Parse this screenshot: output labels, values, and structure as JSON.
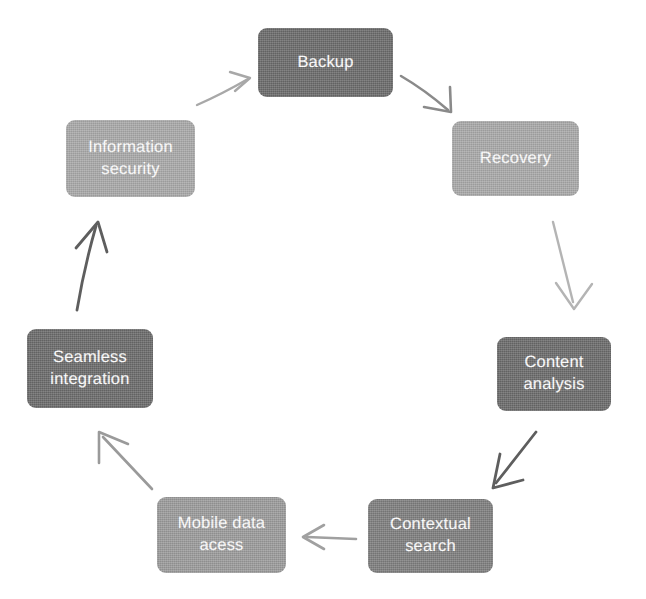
{
  "diagram": {
    "type": "cycle",
    "orientation": "clockwise",
    "background_color": "#ffffff",
    "node_count": 6,
    "arrow_count": 6,
    "nodes": [
      {
        "id": "backup",
        "label": "Backup",
        "lines": "Backup",
        "fill_color": "#6b6b6b",
        "text_color": "#ffffff",
        "position": "top"
      },
      {
        "id": "recovery",
        "label": "Recovery",
        "lines": "Recovery",
        "fill_color": "#a9a9a9",
        "text_color": "#ffffff",
        "position": "upper-right"
      },
      {
        "id": "content-analysis",
        "label": "Content analysis",
        "lines": "Content\nanalysis",
        "fill_color": "#6b6b6b",
        "text_color": "#ffffff",
        "position": "lower-right"
      },
      {
        "id": "contextual-search",
        "label": "Contextual search",
        "lines": "Contextual\nsearch",
        "fill_color": "#7e7e7e",
        "text_color": "#ffffff",
        "position": "bottom-right"
      },
      {
        "id": "mobile-data-acess",
        "label": "Mobile data acess",
        "lines": "Mobile data\nacess",
        "fill_color": "#9b9b9b",
        "text_color": "#ffffff",
        "position": "bottom-left"
      },
      {
        "id": "seamless-integration",
        "label": "Seamless integration",
        "lines": "Seamless\nintegration",
        "fill_color": "#6b6b6b",
        "text_color": "#ffffff",
        "position": "lower-left"
      },
      {
        "id": "information-security",
        "label": "Information security",
        "lines": "Information\nsecurity",
        "fill_color": "#a9a9a9",
        "text_color": "#ffffff",
        "position": "upper-left"
      }
    ],
    "arrows": [
      {
        "id": "arrow-backup-to-recovery",
        "from": "backup",
        "to": "recovery",
        "style": "curved",
        "color": "#8a8a8a"
      },
      {
        "id": "arrow-recovery-to-content",
        "from": "recovery",
        "to": "content-analysis",
        "style": "straight",
        "color": "#b4b4b4"
      },
      {
        "id": "arrow-content-to-contextual",
        "from": "content-analysis",
        "to": "contextual-search",
        "style": "straight",
        "color": "#5e5e5e"
      },
      {
        "id": "arrow-contextual-to-mobile",
        "from": "contextual-search",
        "to": "mobile-data-acess",
        "style": "straight",
        "color": "#a0a0a0"
      },
      {
        "id": "arrow-mobile-to-seamless",
        "from": "mobile-data-acess",
        "to": "seamless-integration",
        "style": "straight",
        "color": "#9a9a9a"
      },
      {
        "id": "arrow-seamless-to-security",
        "from": "seamless-integration",
        "to": "information-security",
        "style": "curved",
        "color": "#5e5e5e"
      },
      {
        "id": "arrow-security-to-backup",
        "from": "information-security",
        "to": "backup",
        "style": "curved",
        "color": "#a8a8a8"
      }
    ]
  }
}
